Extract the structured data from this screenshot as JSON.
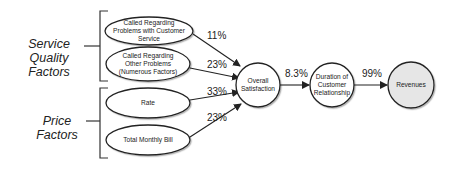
{
  "groups": [
    {
      "label": "Service Quality Factors"
    },
    {
      "label": "Price Factors"
    }
  ],
  "factors": [
    {
      "label": "Called Regarding Problems with Customer Service",
      "weight": "11%"
    },
    {
      "label": "Called Regarding Other Problems (Numerous Factors)",
      "weight": "23%"
    },
    {
      "label": "Rate",
      "weight": "33%"
    },
    {
      "label": "Total Monthly Bill",
      "weight": "23%"
    }
  ],
  "chain": [
    {
      "label": "Overall Satisfaction",
      "fill": "#ffffff"
    },
    {
      "label": "Duration of Customer Relationship",
      "fill": "#ffffff",
      "incoming_weight": "8.3%"
    },
    {
      "label": "Revenues",
      "fill": "#e6e6e6",
      "incoming_weight": "99%"
    }
  ]
}
